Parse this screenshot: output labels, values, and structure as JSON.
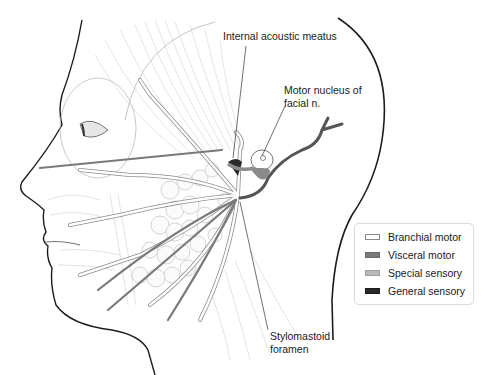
{
  "figure": {
    "labels": {
      "internal_acoustic_meatus": "Internal acoustic meatus",
      "motor_nucleus_line1": "Motor nucleus of",
      "motor_nucleus_line2": "facial n.",
      "stylomastoid_line1": "Stylomastoid",
      "stylomastoid_line2": "foramen"
    }
  },
  "legend": {
    "items": [
      {
        "label": "Branchial motor",
        "color": "#ffffff",
        "border": "#8a8a8a"
      },
      {
        "label": "Visceral motor",
        "color": "#7a7a7a",
        "border": "#6a6a6a"
      },
      {
        "label": "Special sensory",
        "color": "#b8b8b8",
        "border": "#a0a0a0"
      },
      {
        "label": "General sensory",
        "color": "#2a2a2a",
        "border": "#1a1a1a"
      }
    ]
  },
  "colors": {
    "outline": "#1c1c1c",
    "muscle_line": "#c8c8c8",
    "nerve_fill": "#ffffff",
    "nerve_stroke": "#8c8c8c",
    "visceral": "#7a7a7a",
    "sensory_dark": "#555555"
  }
}
